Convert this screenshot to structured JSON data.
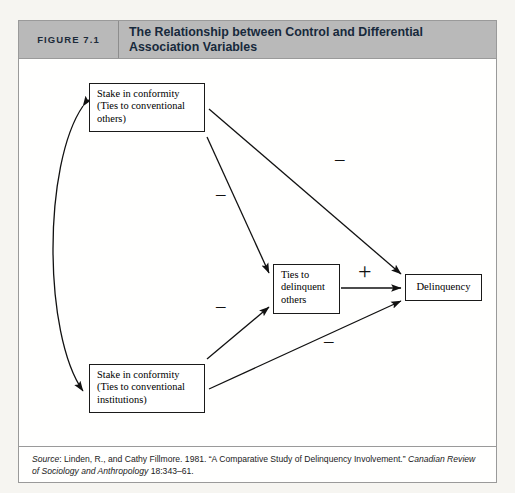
{
  "figure": {
    "number_label": "FIGURE 7.1",
    "title": "The Relationship between Control and Differential Association Variables"
  },
  "nodes": {
    "top_left": "Stake in conformity (Ties to conventional others)",
    "top_left_line1": "Stake in conformity",
    "top_left_line2": "(Ties to conventional",
    "top_left_line3": "others)",
    "bottom_left": "Stake in conformity (Ties to conventional institutions)",
    "bottom_left_line1": "Stake in conformity",
    "bottom_left_line2": "(Ties to conventional",
    "bottom_left_line3": "institutions)",
    "middle": "Ties to delinquent others",
    "middle_line1": "Ties to",
    "middle_line2": "delinquent",
    "middle_line3": "others",
    "right": "Delinquency"
  },
  "edge_labels": {
    "top_to_middle": "–",
    "top_to_delinquency": "–",
    "bottom_to_middle": "–",
    "bottom_to_delinquency": "–",
    "middle_to_delinquency": "+"
  },
  "source": {
    "label": "Source",
    "colon": ": ",
    "text_1": "Linden, R., and Cathy Fillmore. 1981. “A Comparative Study of Delinquency Involvement.” ",
    "journal": "Canadian Review of Sociology and Anthropology",
    "text_2": " 18:343–61."
  },
  "colors": {
    "header_bg": "#b9b9b9",
    "header_text": "#17293c",
    "border": "#9a9a9a",
    "node_border": "#1a1a1a",
    "page_bg": "#f6f5f1"
  }
}
